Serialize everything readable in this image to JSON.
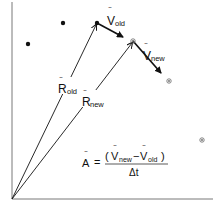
{
  "diagram": {
    "colors": {
      "ink": "#111111",
      "circled": "#666666",
      "background": "#ffffff"
    },
    "axes": {
      "origin": [
        12,
        199
      ],
      "x_end": [
        213,
        199
      ],
      "y_end": [
        12,
        2
      ]
    },
    "points": [
      {
        "id": "p1",
        "x": 28,
        "y": 44,
        "style": "filled"
      },
      {
        "id": "p2",
        "x": 63,
        "y": 23,
        "style": "filled"
      },
      {
        "id": "p_old",
        "x": 97,
        "y": 23,
        "style": "filled"
      },
      {
        "id": "p_new",
        "x": 133,
        "y": 41,
        "style": "circled"
      },
      {
        "id": "p5",
        "x": 169,
        "y": 81,
        "style": "circled"
      },
      {
        "id": "p6",
        "x": 202,
        "y": 140,
        "style": "circled"
      }
    ],
    "vectors": {
      "r_old": {
        "label": "R",
        "subscript": "old"
      },
      "r_new": {
        "label": "R",
        "subscript": "new"
      },
      "v_old": {
        "label": "V",
        "subscript": "old"
      },
      "v_new": {
        "label": "V",
        "subscript": "new"
      }
    },
    "formula": {
      "lhs": "A",
      "equals": "=",
      "numerator_open": "(",
      "v1": "V",
      "v1_sub": "new",
      "minus": "−",
      "v2": "V",
      "v2_sub": "old",
      "numerator_close": ")",
      "denominator": "Δt"
    }
  }
}
